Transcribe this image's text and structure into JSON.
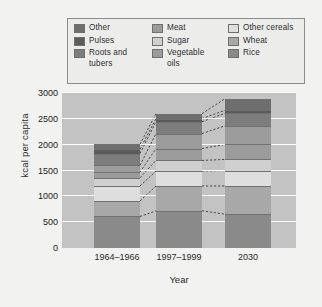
{
  "chart_data": {
    "type": "bar",
    "subtype": "stacked-bar",
    "title": "",
    "xlabel": "Year",
    "ylabel": "kcal per capita",
    "categories": [
      "1964–1966",
      "1997–1999",
      "2030"
    ],
    "ylim": [
      0,
      3000
    ],
    "yticks": [
      0,
      500,
      1000,
      1500,
      2000,
      2500,
      3000
    ],
    "grid": true,
    "legend_position": "top",
    "stack_order_bottom_to_top": [
      "Rice",
      "Wheat",
      "Other cereals",
      "Sugar",
      "Vegetable oils",
      "Meat",
      "Roots and tubers",
      "Pulses",
      "Other"
    ],
    "series": [
      {
        "name": "Rice",
        "color": "#8a8a8a",
        "values": [
          610,
          720,
          655
        ]
      },
      {
        "name": "Wheat",
        "color": "#a8a8a8",
        "values": [
          300,
          480,
          545
        ]
      },
      {
        "name": "Other cereals",
        "color": "#dedede",
        "values": [
          290,
          290,
          300
        ]
      },
      {
        "name": "Sugar",
        "color": "#d0d0d0",
        "values": [
          160,
          205,
          215
        ]
      },
      {
        "name": "Vegetable oils",
        "color": "#9b9b9b",
        "values": [
          110,
          230,
          290
        ]
      },
      {
        "name": "Meat",
        "color": "#9b9b9b",
        "values": [
          130,
          290,
          360
        ]
      },
      {
        "name": "Roots and tubers",
        "color": "#7d7d7d",
        "values": [
          230,
          230,
          240
        ]
      },
      {
        "name": "Pulses",
        "color": "#5c5c5c",
        "values": [
          80,
          60,
          60
        ]
      },
      {
        "name": "Other",
        "color": "#6e6e6e",
        "values": [
          100,
          95,
          225
        ]
      }
    ],
    "totals": [
      2010,
      2600,
      2890
    ],
    "connectors": true,
    "connector_style": "dashed"
  },
  "legend": {
    "items": [
      {
        "label": "Other",
        "color": "#6e6e6e"
      },
      {
        "label": "Meat",
        "color": "#9b9b9b"
      },
      {
        "label": "Other cereals",
        "color": "#dedede"
      },
      {
        "label": "Pulses",
        "color": "#5c5c5c"
      },
      {
        "label": "Sugar",
        "color": "#d0d0d0"
      },
      {
        "label": "Wheat",
        "color": "#a8a8a8"
      },
      {
        "label": "Roots and\ntubers",
        "color": "#7d7d7d"
      },
      {
        "label": "Vegetable\noils",
        "color": "#9b9b9b"
      },
      {
        "label": "Rice",
        "color": "#8a8a8a"
      }
    ]
  },
  "axes": {
    "y_title": "kcal per capita",
    "x_title": "Year",
    "y_ticks": [
      "3000",
      "2500",
      "2000",
      "1500",
      "1000",
      "500",
      "0"
    ],
    "x_ticks": [
      "1964–1966",
      "1997–1999",
      "2030"
    ]
  },
  "colors": {
    "page_background": "#f2f2f0",
    "plot_background": "#c3c3c3",
    "gridline": "#fdfdfd",
    "legend_background": "#ececeb",
    "legend_border": "#8d8d8d",
    "segment_edge": "#707070",
    "connector": "#3a3a3a"
  }
}
